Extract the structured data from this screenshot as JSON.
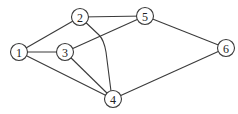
{
  "diagram": {
    "type": "undirected-graph",
    "background": "#ffffff",
    "stroke_color": "#3a3a3a",
    "node_radius": 8.5,
    "nodes": [
      {
        "id": "1",
        "label": "1",
        "x": 19,
        "y": 52
      },
      {
        "id": "2",
        "label": "2",
        "x": 80,
        "y": 17
      },
      {
        "id": "3",
        "label": "3",
        "x": 65,
        "y": 52
      },
      {
        "id": "4",
        "label": "4",
        "x": 113,
        "y": 99
      },
      {
        "id": "5",
        "label": "5",
        "x": 145,
        "y": 16
      },
      {
        "id": "6",
        "label": "6",
        "x": 226,
        "y": 48
      }
    ],
    "edges": [
      {
        "from": "1",
        "to": "2"
      },
      {
        "from": "1",
        "to": "3"
      },
      {
        "from": "1",
        "to": "4"
      },
      {
        "from": "2",
        "to": "5"
      },
      {
        "from": "2",
        "to": "4",
        "curved": true
      },
      {
        "from": "3",
        "to": "5"
      },
      {
        "from": "3",
        "to": "4"
      },
      {
        "from": "5",
        "to": "6"
      },
      {
        "from": "4",
        "to": "6"
      }
    ]
  }
}
